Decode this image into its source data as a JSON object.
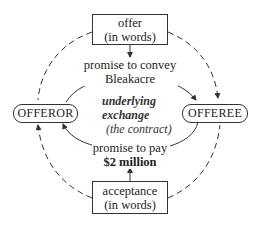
{
  "diagram": {
    "offer_box": {
      "line1": "offer",
      "line2": "(in words)"
    },
    "acceptance_box": {
      "line1": "acceptance",
      "line2": "(in words)"
    },
    "offeror": "OFFEROR",
    "offeree": "OFFEREE",
    "top_promise": {
      "line1": "promise to convey",
      "line2": "Bleakacre"
    },
    "bottom_promise": {
      "line1": "promise to pay",
      "line2": "$2 million"
    },
    "center": {
      "line1": "underlying",
      "line2": "exchange",
      "line3": "(the contract)"
    }
  },
  "colors": {
    "line": "#333333",
    "background": "#ffffff",
    "text": "#222222"
  }
}
